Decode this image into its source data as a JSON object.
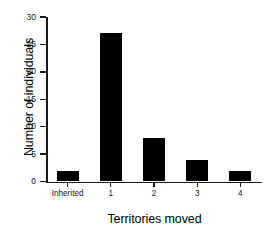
{
  "chart_data": {
    "type": "bar",
    "title": "",
    "xlabel": "Territories moved",
    "ylabel": "Number of individuals",
    "categories": [
      "Inherited",
      "1",
      "2",
      "3",
      "4"
    ],
    "values": [
      2,
      27,
      8,
      4,
      2
    ],
    "ylim": [
      0,
      30
    ],
    "yticks": [
      0,
      5,
      10,
      15,
      20,
      25,
      30
    ],
    "ytick_labels": [
      "0",
      "5",
      "10",
      "15",
      "20",
      "25",
      "30"
    ],
    "xtick_labels": [
      "Inherited",
      "1",
      "2",
      "3",
      "4"
    ],
    "grid": false,
    "legend": false,
    "bar_color": "#000000",
    "axis_color": "#1a1a1a",
    "background_color": "#ffffff"
  }
}
